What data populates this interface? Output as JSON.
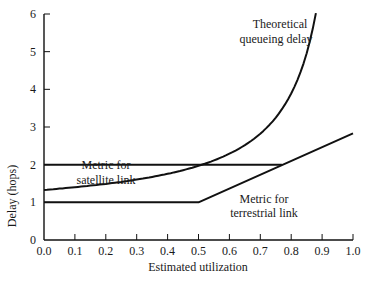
{
  "chart_data": {
    "type": "line",
    "title": "",
    "xlabel": "Estimated utilization",
    "ylabel": "Delay (hops)",
    "xlim": [
      0.0,
      1.0
    ],
    "ylim": [
      0,
      6
    ],
    "grid": false,
    "legend": "none (inline annotations)",
    "x_ticks": [
      "0.0",
      "0.1",
      "0.2",
      "0.3",
      "0.4",
      "0.5",
      "0.6",
      "0.7",
      "0.8",
      "0.9",
      "1.0"
    ],
    "y_ticks": [
      "0",
      "1",
      "2",
      "3",
      "4",
      "5",
      "6"
    ],
    "series": [
      {
        "name": "Theoretical queueing delay",
        "x": [
          0.0,
          0.1,
          0.2,
          0.3,
          0.4,
          0.5,
          0.56,
          0.6,
          0.7,
          0.75,
          0.8,
          0.84,
          0.88
        ],
        "y": [
          1.33,
          1.4,
          1.48,
          1.6,
          1.76,
          1.97,
          2.0,
          2.29,
          2.82,
          3.25,
          3.9,
          4.7,
          6.0
        ]
      },
      {
        "name": "Metric for satellite link",
        "x": [
          0.0,
          0.77
        ],
        "y": [
          2.0,
          2.0
        ]
      },
      {
        "name": "Metric for terrestrial link",
        "x": [
          0.0,
          0.5,
          1.0
        ],
        "y": [
          1.0,
          1.0,
          2.83
        ]
      }
    ],
    "annotations": [
      {
        "text": [
          "Theoretical",
          "queueing delay"
        ],
        "near": "top of queueing curve"
      },
      {
        "text": [
          "Metric for",
          "satellite link"
        ],
        "near": "y=2 line, x≈0.2"
      },
      {
        "text": [
          "Metric for",
          "terrestrial link"
        ],
        "near": "below terrestrial line, x≈0.65"
      }
    ]
  },
  "labels": {
    "xlabel": "Estimated utilization",
    "ylabel": "Delay (hops)",
    "queue_l1": "Theoretical",
    "queue_l2": "queueing delay",
    "sat_l1": "Metric for",
    "sat_l2": "satellite link",
    "ter_l1": "Metric for",
    "ter_l2": "terrestrial link"
  }
}
